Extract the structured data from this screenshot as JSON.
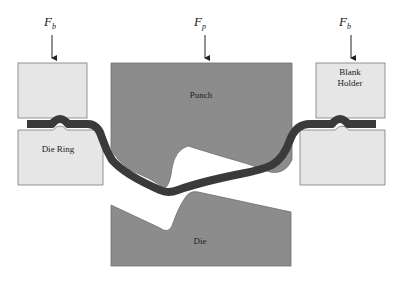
{
  "diagram": {
    "type": "sheet metal deep drawing / stamping schematic",
    "colors": {
      "background": "#ffffff",
      "holder_fill": "#e6e6e6",
      "holder_stroke": "#7a7a7a",
      "tool_fill": "#8c8c8c",
      "tool_stroke": "#6e6e6e",
      "sheet_fill": "#3a3a3a",
      "arrow": "#222222"
    },
    "forces": {
      "left": {
        "symbol": "F",
        "subscript": "b"
      },
      "center": {
        "symbol": "F",
        "subscript": "p"
      },
      "right": {
        "symbol": "F",
        "subscript": "b"
      }
    },
    "labels": {
      "punch": "Punch",
      "die": "Die",
      "die_ring": "Die Ring",
      "blank_holder_line1": "Blank",
      "blank_holder_line2": "Holder"
    }
  }
}
